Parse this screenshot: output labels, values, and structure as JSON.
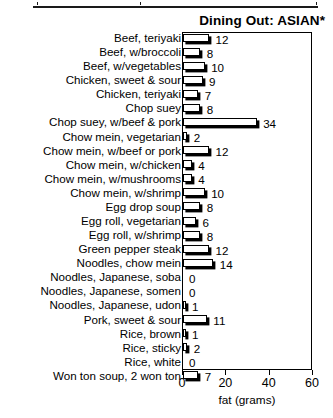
{
  "chart_data": {
    "type": "bar",
    "orientation": "horizontal",
    "title": "Dining Out: ASIAN*",
    "xlabel": "fat (grams)",
    "ylabel": "",
    "xlim": [
      0,
      60
    ],
    "xticks": [
      0,
      20,
      40,
      60
    ],
    "xtick_labels": [
      "0",
      "20",
      "40",
      "60"
    ],
    "grid": false,
    "legend": false,
    "categories": [
      "Beef, teriyaki",
      "Beef, w/broccoli",
      "Beef, w/vegetables",
      "Chicken, sweet & sour",
      "Chicken, teriyaki",
      "Chop suey",
      "Chop suey, w/beef & pork",
      "Chow mein, vegetarian",
      "Chow mein, w/beef or pork",
      "Chow mein, w/chicken",
      "Chow mein, w/mushrooms",
      "Chow mein, w/shrimp",
      "Egg drop soup",
      "Egg roll, vegetarian",
      "Egg roll, w/shrimp",
      "Green pepper steak",
      "Noodles, chow mein",
      "Noodles, Japanese, soba",
      "Noodles, Japanese, somen",
      "Noodles, Japanese, udon",
      "Pork, sweet & sour",
      "Rice, brown",
      "Rice, sticky",
      "Rice, white",
      "Won ton soup, 2 won ton"
    ],
    "values": [
      12,
      8,
      10,
      9,
      7,
      8,
      34,
      2,
      12,
      4,
      4,
      10,
      8,
      6,
      8,
      12,
      14,
      0,
      0,
      1,
      11,
      1,
      2,
      0,
      7
    ],
    "value_labels": [
      "12",
      "8",
      "10",
      "9",
      "7",
      "8",
      "34",
      "2",
      "12",
      "4",
      "4",
      "10",
      "8",
      "6",
      "8",
      "12",
      "14",
      "0",
      "0",
      "1",
      "11",
      "1",
      "2",
      "0",
      "7"
    ]
  },
  "axis": {
    "label": "fat (grams)",
    "ticks": [
      "0",
      "20",
      "40",
      "60"
    ]
  },
  "title": "Dining Out: ASIAN*"
}
